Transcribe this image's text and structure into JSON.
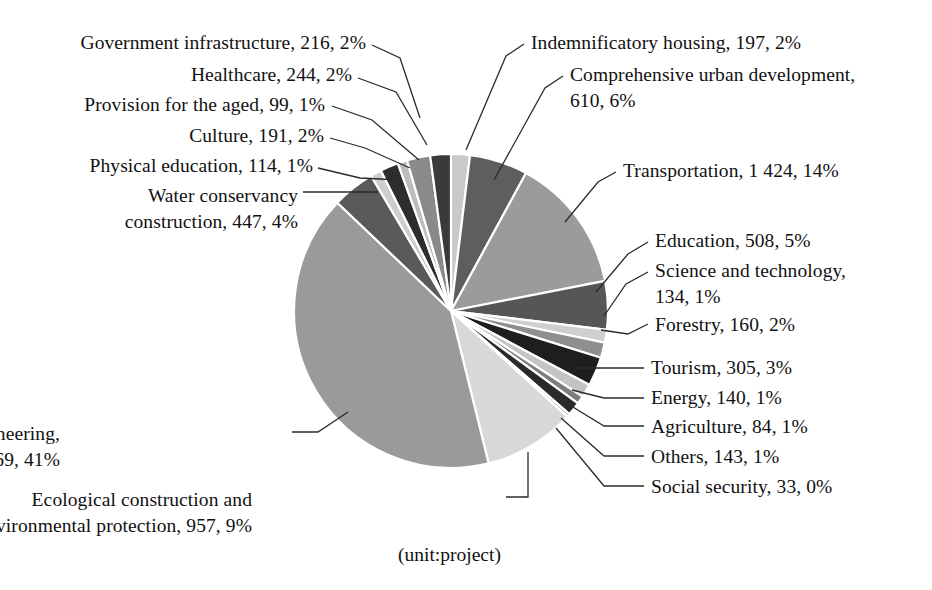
{
  "chart_data": {
    "type": "pie",
    "title": "",
    "subtitle": "",
    "unit_caption": "(unit:project)",
    "total": 10254,
    "legend_position": "callout-labels",
    "grid": false,
    "start_angle_deg": 0,
    "direction": "clockwise",
    "categories": [
      "Indemnificatory housing",
      "Comprehensive urban development",
      "Transportation",
      "Education",
      "Science and technology",
      "Forestry",
      "Tourism",
      "Energy",
      "Agriculture",
      "Others",
      "Social security",
      "Ecological construction and environmental protection",
      "Municipal engineering",
      "Water conservancy construction",
      "Physical education",
      "Culture",
      "Provision for the aged",
      "Healthcare",
      "Government infrastructure"
    ],
    "values": [
      197,
      610,
      1424,
      508,
      134,
      160,
      305,
      140,
      84,
      143,
      33,
      957,
      4169,
      447,
      114,
      191,
      99,
      244,
      216
    ],
    "percents": [
      2,
      6,
      14,
      5,
      1,
      2,
      3,
      1,
      1,
      1,
      0,
      9,
      41,
      4,
      1,
      2,
      1,
      2,
      2
    ],
    "slice_colors": [
      "#c9c9c9",
      "#5e5e5e",
      "#9b9b9b",
      "#565656",
      "#cfcfcf",
      "#8f8f8f",
      "#1e1e1e",
      "#c4c4c4",
      "#7d7d7d",
      "#2a2a2a",
      "#b5b5b5",
      "#d8d8d8",
      "#9a9a9a",
      "#5a5a5a",
      "#cdcdcd",
      "#2d2d2d",
      "#bdbdbd",
      "#8a8a8a",
      "#3a3a3a"
    ]
  },
  "pie": {
    "center_x": 451,
    "center_y": 311,
    "radius": 157,
    "separator_color": "#ffffff",
    "separator_width": 2.2
  },
  "labels": [
    {
      "id": "government-infrastructure",
      "lines": [
        "Government infrastructure, 216, 2%"
      ],
      "side": "left",
      "x": 366,
      "y": 30,
      "leader": [
        [
          372,
          45
        ],
        [
          400,
          58
        ],
        [
          420,
          118
        ]
      ]
    },
    {
      "id": "healthcare",
      "lines": [
        "Healthcare, 244, 2%"
      ],
      "side": "left",
      "x": 352,
      "y": 62,
      "leader": [
        [
          358,
          78
        ],
        [
          396,
          92
        ],
        [
          427,
          145
        ]
      ]
    },
    {
      "id": "provision-for-the-aged",
      "lines": [
        "Provision for the aged, 99, 1%"
      ],
      "side": "left",
      "x": 325,
      "y": 92,
      "leader": [
        [
          332,
          106
        ],
        [
          372,
          120
        ],
        [
          419,
          160
        ]
      ]
    },
    {
      "id": "culture",
      "lines": [
        "Culture, 191, 2%"
      ],
      "side": "left",
      "x": 324,
      "y": 123,
      "leader": [
        [
          330,
          138
        ],
        [
          365,
          148
        ],
        [
          410,
          168
        ]
      ]
    },
    {
      "id": "physical-education",
      "lines": [
        "Physical education, 114, 1%"
      ],
      "side": "left",
      "x": 313,
      "y": 153,
      "leader": [
        [
          318,
          168
        ],
        [
          360,
          178
        ],
        [
          400,
          180
        ]
      ]
    },
    {
      "id": "water-conservancy-construction",
      "lines": [
        "Water conservancy",
        "construction, 447, 4%"
      ],
      "side": "left",
      "x": 298,
      "y": 183,
      "leader": [
        [
          303,
          192
        ],
        [
          378,
          192
        ]
      ]
    },
    {
      "id": "indemnificatory-housing",
      "lines": [
        "Indemnificatory housing, 197, 2%"
      ],
      "side": "right",
      "x": 531,
      "y": 30,
      "leader": [
        [
          524,
          44
        ],
        [
          506,
          56
        ],
        [
          466,
          150
        ]
      ]
    },
    {
      "id": "comprehensive-urban-development",
      "lines": [
        "Comprehensive urban development,",
        "610, 6%"
      ],
      "side": "right",
      "x": 570,
      "y": 62,
      "leader": [
        [
          563,
          76
        ],
        [
          545,
          88
        ],
        [
          494,
          180
        ]
      ]
    },
    {
      "id": "transportation",
      "lines": [
        "Transportation, 1 424, 14%"
      ],
      "side": "right",
      "x": 623,
      "y": 158,
      "leader": [
        [
          616,
          172
        ],
        [
          598,
          182
        ],
        [
          565,
          222
        ]
      ]
    },
    {
      "id": "education",
      "lines": [
        "Education, 508, 5%"
      ],
      "side": "right",
      "x": 655,
      "y": 228,
      "leader": [
        [
          648,
          242
        ],
        [
          628,
          254
        ],
        [
          596,
          292
        ]
      ]
    },
    {
      "id": "science-and-technology",
      "lines": [
        "Science and technology,",
        "134, 1%"
      ],
      "side": "right",
      "x": 655,
      "y": 258,
      "leader": [
        [
          648,
          272
        ],
        [
          626,
          284
        ],
        [
          604,
          316
        ]
      ]
    },
    {
      "id": "forestry",
      "lines": [
        "Forestry, 160, 2%"
      ],
      "side": "right",
      "x": 655,
      "y": 312,
      "leader": [
        [
          648,
          324
        ],
        [
          628,
          334
        ],
        [
          601,
          330
        ]
      ]
    },
    {
      "id": "tourism",
      "lines": [
        "Tourism, 305, 3%"
      ],
      "side": "right",
      "x": 651,
      "y": 355,
      "leader": [
        [
          644,
          368
        ],
        [
          604,
          368
        ],
        [
          575,
          368
        ]
      ]
    },
    {
      "id": "energy",
      "lines": [
        "Energy, 140, 1%"
      ],
      "side": "right",
      "x": 651,
      "y": 385,
      "leader": [
        [
          644,
          398
        ],
        [
          604,
          398
        ],
        [
          572,
          390
        ]
      ]
    },
    {
      "id": "agriculture",
      "lines": [
        "Agriculture, 84, 1%"
      ],
      "side": "right",
      "x": 651,
      "y": 414,
      "leader": [
        [
          644,
          426
        ],
        [
          604,
          426
        ],
        [
          568,
          404
        ]
      ]
    },
    {
      "id": "others",
      "lines": [
        "Others, 143, 1%"
      ],
      "side": "right",
      "x": 651,
      "y": 444,
      "leader": [
        [
          644,
          456
        ],
        [
          604,
          456
        ],
        [
          561,
          418
        ]
      ]
    },
    {
      "id": "social-security",
      "lines": [
        "Social security, 33, 0%"
      ],
      "side": "right",
      "x": 651,
      "y": 474,
      "leader": [
        [
          644,
          486
        ],
        [
          604,
          486
        ],
        [
          556,
          428
        ]
      ]
    },
    {
      "id": "municipal-engineering",
      "lines": [
        "Municipal engineering,",
        "4 169, 41%"
      ],
      "side": "left",
      "x": 60,
      "y": 421,
      "leader": [
        [
          292,
          432
        ],
        [
          318,
          432
        ],
        [
          348,
          412
        ]
      ]
    },
    {
      "id": "ecological-construction",
      "lines": [
        "Ecological construction and",
        "environmental protection, 957, 9%"
      ],
      "side": "left",
      "x": 252,
      "y": 487,
      "leader": [
        [
          506,
          497
        ],
        [
          528,
          497
        ],
        [
          528,
          452
        ]
      ]
    }
  ],
  "caption": {
    "text": "(unit:project)",
    "x": 398,
    "y": 542
  }
}
